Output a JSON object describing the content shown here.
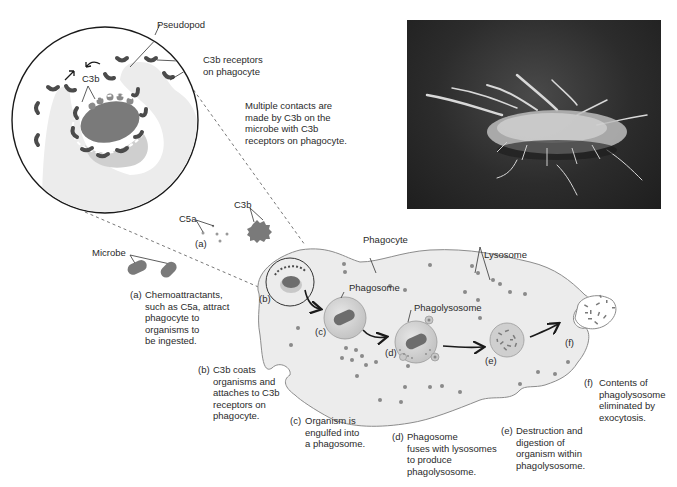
{
  "figure": {
    "colors": {
      "cell_fill": "#ececec",
      "cell_stroke": "#8c8c8c",
      "microbe": "#7a7a7a",
      "receptor": "#4b4b4b",
      "lysosome": "#8a8a8a",
      "vesicle": "#d6d6d6",
      "photo_bg": "#2c2c2c"
    }
  },
  "inset": {
    "pseudopod_label": "Pseudopod",
    "receptor_label": "C3b receptors\non phagocyte",
    "c3b_label": "C3b",
    "note": "Multiple contacts are\nmade by C3b on the\nmicrobe with C3b\nreceptors on phagocyte."
  },
  "photo": {
    "description": "Scanning electron micrograph of a phagocyte with pseudopods"
  },
  "labels": {
    "c5a": "C5a",
    "c3b": "C3b",
    "a_marker": "(a)",
    "microbe": "Microbe",
    "phagocyte": "Phagocyte",
    "lysosome": "Lysosome",
    "phagosome": "Phagosome",
    "phagolysosome": "Phagolysosome",
    "b_marker": "(b)",
    "c_marker": "(c)",
    "d_marker": "(d)",
    "e_marker": "(e)",
    "f_marker": "(f)"
  },
  "steps": [
    {
      "letter": "(a)",
      "text": "Chemoattractants,\nsuch as C5a, attract\nphagocyte to\norganisms to\nbe ingested."
    },
    {
      "letter": "(b)",
      "text": "C3b coats\norganisms and\nattaches to C3b\nreceptors on\nphagocyte."
    },
    {
      "letter": "(c)",
      "text": "Organism is\nengulfed into\na phagosome."
    },
    {
      "letter": "(d)",
      "text": "Phagosome\nfuses with lysosomes\nto produce\nphagolysosome."
    },
    {
      "letter": "(e)",
      "text": "Destruction and\ndigestion of\norganism within\nphagolysosome."
    },
    {
      "letter": "(f)",
      "text": "Contents of\nphagolysosome\neliminated by\nexocytosis."
    }
  ]
}
